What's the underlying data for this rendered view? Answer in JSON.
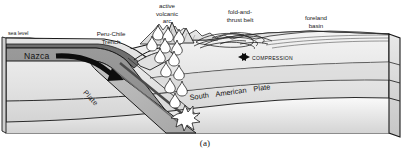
{
  "figure": {
    "caption": "(a)",
    "type": "geological-block-diagram"
  },
  "labels": {
    "sea_level": "sea level",
    "trench": "Peru-Chile\nTrench",
    "volcanic_arc": "active\nvolcanic\narc",
    "fold_thrust_belt": "fold-and-\nthrust belt",
    "foreland_basin": "foreland\nbasin",
    "compression": "COMPRESSION",
    "nazca_plate": "Nazca",
    "nazca_plate_word": "Plate",
    "south_american_plate": [
      "South",
      "American",
      "Plate"
    ]
  },
  "icons": {
    "compression_arrow": "double-convergent-arrow-icon",
    "subduction_arrow": "curved-motion-arrow-icon",
    "magma_diapir": "magma-teardrop-icon",
    "melting_burst": "starburst-icon"
  },
  "colors": {
    "outline": "#1a1a1a",
    "ocean_crust": "#8e8e8e",
    "mantle_light": "#e8e8e8",
    "crust_mid": "#c9c9c9",
    "crust_dark": "#a8a8a8",
    "slab": "#b4b4b4",
    "background": "#ffffff",
    "text": "#141414"
  }
}
